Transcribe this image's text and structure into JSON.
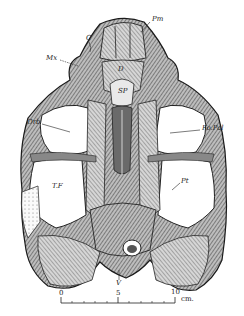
{
  "figure": {
    "labels": [
      {
        "id": "pm",
        "text": "Pm",
        "x": 152,
        "y": 19
      },
      {
        "id": "c",
        "text": "C",
        "x": 86,
        "y": 38
      },
      {
        "id": "mx",
        "text": "Mx",
        "x": 49,
        "y": 57
      },
      {
        "id": "d",
        "text": "D",
        "x": 118,
        "y": 69
      },
      {
        "id": "sp",
        "text": "SP",
        "x": 121,
        "y": 91
      },
      {
        "id": "orb",
        "text": "Orb",
        "x": 29,
        "y": 121
      },
      {
        "id": "fo-pal",
        "text": "Fo.Pal",
        "x": 201,
        "y": 127
      },
      {
        "id": "tf",
        "text": "T.F",
        "x": 53,
        "y": 186
      },
      {
        "id": "pt",
        "text": "Pt",
        "x": 181,
        "y": 180
      },
      {
        "id": "v",
        "text": "V",
        "x": 116,
        "y": 282
      }
    ],
    "scale_bar": {
      "ticks": [
        "0",
        "5",
        "10"
      ],
      "unit": "cm.",
      "x_start": 61,
      "x_end": 175,
      "y": 303
    }
  }
}
